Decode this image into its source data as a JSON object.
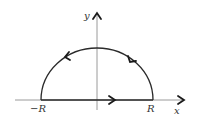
{
  "diagram": {
    "type": "contour",
    "axes": {
      "x_label": "x",
      "y_label": "y"
    },
    "points": {
      "left_label": "−R",
      "right_label": "R"
    },
    "segments": [
      {
        "name": "real-axis-segment",
        "from": "−R",
        "to": "R",
        "direction": "right"
      },
      {
        "name": "semicircular-arc",
        "from": "R",
        "to": "−R",
        "direction": "counterclockwise"
      }
    ],
    "colors": {
      "axis": "#9a9a9a",
      "contour": "#2a2a2a",
      "arrow": "#1a1a1a",
      "label": "#333333"
    }
  }
}
